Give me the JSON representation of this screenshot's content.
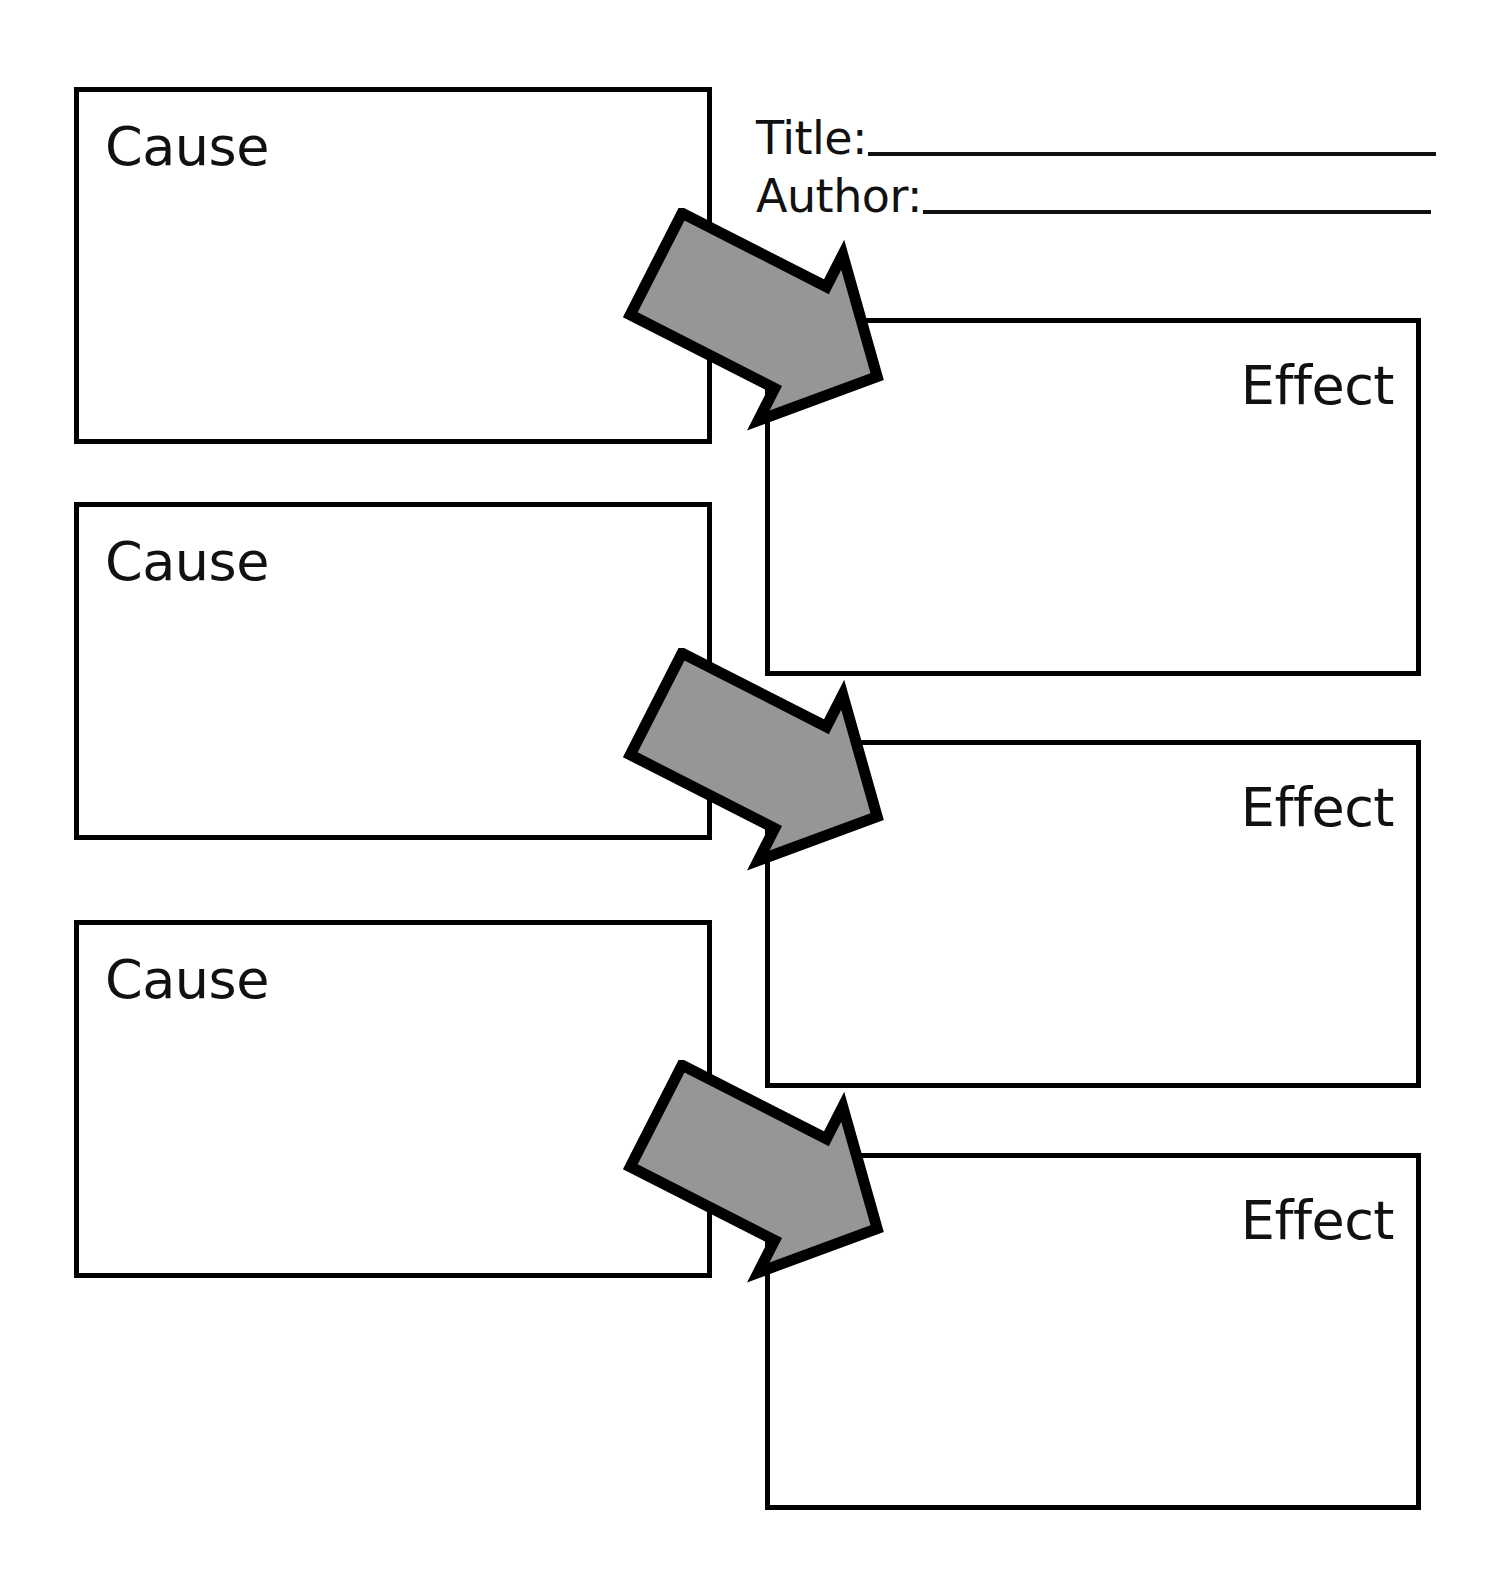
{
  "page": {
    "kind": "cause-and-effect-graphic-organizer",
    "width": 1494,
    "height": 1594,
    "background_color": "#ffffff"
  },
  "header": {
    "title_label": "Title:",
    "author_label": "Author:",
    "title_value": "",
    "author_value": "",
    "title_placeholder": "",
    "author_placeholder": ""
  },
  "colors": {
    "outline": "#000000",
    "text": "#111111",
    "arrow_fill": "#969696",
    "arrow_stroke": "#000000",
    "paper": "#ffffff"
  },
  "causes": [
    {
      "label": "Cause",
      "value": "",
      "placeholder": ""
    },
    {
      "label": "Cause",
      "value": "",
      "placeholder": ""
    },
    {
      "label": "Cause",
      "value": "",
      "placeholder": ""
    }
  ],
  "effects": [
    {
      "label": "Effect",
      "value": "",
      "placeholder": ""
    },
    {
      "label": "Effect",
      "value": "",
      "placeholder": ""
    },
    {
      "label": "Effect",
      "value": "",
      "placeholder": ""
    }
  ],
  "arrows": [
    {
      "icon": "block-arrow-down-right-icon",
      "from": "cause-1",
      "to": "effect-1"
    },
    {
      "icon": "block-arrow-down-right-icon",
      "from": "cause-2",
      "to": "effect-2"
    },
    {
      "icon": "block-arrow-down-right-icon",
      "from": "cause-3",
      "to": "effect-3"
    }
  ]
}
